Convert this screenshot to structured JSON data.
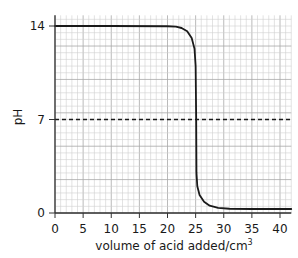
{
  "chart_data": {
    "type": "line",
    "title": "",
    "xlabel": "volume of acid added/cm",
    "xlabel_superscript": "3",
    "ylabel": "pH",
    "xlim": [
      0,
      42
    ],
    "ylim": [
      0,
      14.8
    ],
    "x_ticks": [
      0,
      5,
      10,
      15,
      20,
      25,
      30,
      35,
      40
    ],
    "y_ticks": [
      0,
      7,
      14
    ],
    "grid": true,
    "grid_minor_x": 1,
    "grid_minor_y": 0.5,
    "legend": null,
    "series": [
      {
        "name": "titration curve",
        "style": "solid",
        "color": "#1a1a1a",
        "points": [
          [
            0,
            14.0
          ],
          [
            10,
            14.0
          ],
          [
            20,
            13.98
          ],
          [
            21.5,
            13.95
          ],
          [
            22.5,
            13.85
          ],
          [
            23.5,
            13.6
          ],
          [
            24.3,
            13.1
          ],
          [
            24.8,
            12.3
          ],
          [
            25.0,
            11.0
          ],
          [
            25.1,
            7.0
          ],
          [
            25.15,
            3.0
          ],
          [
            25.3,
            2.0
          ],
          [
            25.7,
            1.35
          ],
          [
            26.5,
            0.85
          ],
          [
            27.5,
            0.55
          ],
          [
            29,
            0.38
          ],
          [
            31,
            0.32
          ],
          [
            35,
            0.3
          ],
          [
            42,
            0.3
          ]
        ]
      },
      {
        "name": "pH 7 reference",
        "style": "dashed",
        "color": "#1a1a1a",
        "points": [
          [
            0,
            7
          ],
          [
            42,
            7
          ]
        ]
      }
    ]
  },
  "colors": {
    "grid_minor": "#d0d0d0",
    "grid_major": "#a8a8a8",
    "axis": "#333333",
    "curve": "#1a1a1a"
  }
}
